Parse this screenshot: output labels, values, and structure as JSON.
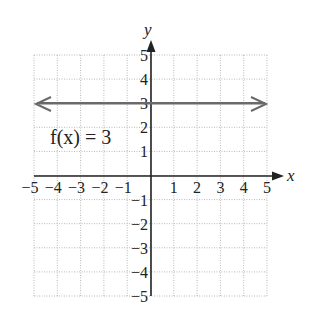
{
  "chart_data": {
    "type": "line",
    "title": "",
    "xlabel": "x",
    "ylabel": "y",
    "xlim": [
      -5,
      5
    ],
    "ylim": [
      -5,
      5
    ],
    "grid": true,
    "x_ticks": [
      "-5",
      "-4",
      "-3",
      "-2",
      "-1",
      "1",
      "2",
      "3",
      "4",
      "5"
    ],
    "y_ticks": [
      "5",
      "4",
      "3",
      "2",
      "1",
      "-1",
      "-2",
      "-3",
      "-4",
      "-5"
    ],
    "series": [
      {
        "name": "f(x) = 3",
        "x": [
          -5,
          5
        ],
        "y": [
          3,
          3
        ],
        "color": "#666666",
        "arrows": "both"
      }
    ],
    "annotations": [
      {
        "text": "f(x) = 3",
        "x": -4.2,
        "y": 1.5
      }
    ]
  },
  "labels": {
    "x_axis": "x",
    "y_axis": "y",
    "function_label": "f(x) = 3",
    "x_ticks": [
      "−5",
      "−4",
      "−3",
      "−2",
      "−1",
      "1",
      "2",
      "3",
      "4",
      "5"
    ],
    "y_ticks_pos": [
      "5",
      "4",
      "3",
      "2",
      "1"
    ],
    "y_ticks_neg": [
      "−1",
      "−2",
      "−3",
      "−4",
      "−5"
    ]
  }
}
